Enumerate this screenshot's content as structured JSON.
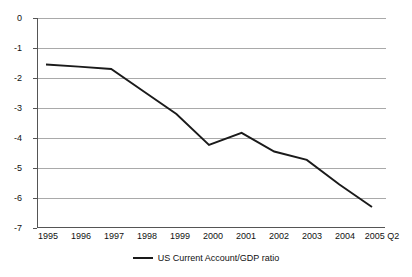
{
  "chart_data": {
    "type": "line",
    "title": "",
    "xlabel": "",
    "ylabel": "",
    "x": [
      "1995",
      "1996",
      "1997",
      "1998",
      "1999",
      "2000",
      "2001",
      "2002",
      "2003",
      "2004",
      "2005 Q2"
    ],
    "xtick_labels": [
      "1995",
      "1996",
      "1997",
      "1998",
      "1999",
      "2000",
      "2001",
      "2002",
      "2003",
      "2004",
      "2005 Q2"
    ],
    "ytick_labels": [
      "0",
      "-1",
      "-2",
      "-3",
      "-4",
      "-5",
      "-6",
      "-7"
    ],
    "ytick_values": [
      0,
      -1,
      -2,
      -3,
      -4,
      -5,
      -6,
      -7
    ],
    "ylim": [
      -7,
      0
    ],
    "grid": true,
    "legend_position": "bottom-center",
    "series": [
      {
        "name": "US Current Account/GDP ratio",
        "color": "#1a1a1a",
        "values": [
          -1.55,
          -1.62,
          -1.7,
          -2.45,
          -3.2,
          -4.23,
          -3.83,
          -4.45,
          -4.73,
          -5.55,
          -6.3
        ]
      }
    ],
    "legend": [
      "US Current Account/GDP ratio"
    ]
  },
  "legend": {
    "entries": [
      {
        "label": "US Current Account/GDP ratio",
        "marker": "line-swatch",
        "color": "#1a1a1a"
      }
    ]
  },
  "axes": {
    "y_label_0": "0",
    "y_label_1": "-1",
    "y_label_2": "-2",
    "y_label_3": "-3",
    "y_label_4": "-4",
    "y_label_5": "-5",
    "y_label_6": "-6",
    "y_label_7": "-7",
    "x_label_0": "1995",
    "x_label_1": "1996",
    "x_label_2": "1997",
    "x_label_3": "1998",
    "x_label_4": "1999",
    "x_label_5": "2000",
    "x_label_6": "2001",
    "x_label_7": "2002",
    "x_label_8": "2003",
    "x_label_9": "2004",
    "x_label_10": "2005 Q2"
  },
  "colors": {
    "series": "#1a1a1a",
    "grid": "#a9a9a9",
    "axis": "#555555",
    "text": "#111111",
    "background": "#ffffff"
  }
}
